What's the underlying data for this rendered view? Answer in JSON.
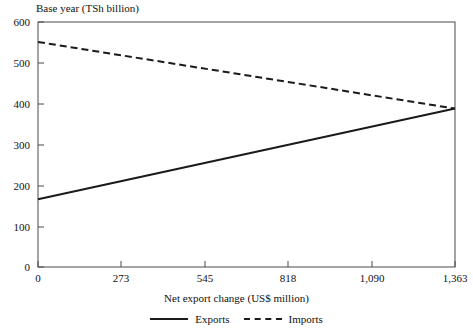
{
  "chart_data": {
    "type": "line",
    "title": "",
    "ylabel": "Base year (TSh billion)",
    "xlabel": "Net export change (US$ million)",
    "grid": false,
    "legend_position": "bottom-center",
    "xlim": [
      0,
      1363
    ],
    "ylim": [
      0,
      600
    ],
    "x_ticks": [
      0,
      273,
      545,
      818,
      1090,
      1363
    ],
    "x_tick_labels": [
      "0",
      "273",
      "545",
      "818",
      "1,090",
      "1,363"
    ],
    "y_ticks": [
      0,
      100,
      200,
      300,
      400,
      500,
      600
    ],
    "y_tick_labels": [
      "0",
      "100",
      "200",
      "300",
      "400",
      "500",
      "600"
    ],
    "x": [
      0,
      1363
    ],
    "series": [
      {
        "name": "Exports",
        "style": "solid",
        "color": "#1a1a1a",
        "values": [
          166,
          388
        ]
      },
      {
        "name": "Imports",
        "style": "dashed",
        "color": "#1a1a1a",
        "values": [
          551,
          388
        ]
      }
    ]
  },
  "axes": {
    "y_title": "Base year (TSh billion)",
    "x_title": "Net export change (US$ million)",
    "y_tick_labels": [
      "600",
      "500",
      "400",
      "300",
      "200",
      "100",
      "0"
    ],
    "x_tick_labels": [
      "0",
      "273",
      "545",
      "818",
      "1,090",
      "1,363"
    ]
  },
  "legend": {
    "items": [
      {
        "label": "Exports",
        "style": "solid"
      },
      {
        "label": "Imports",
        "style": "dashed"
      }
    ]
  },
  "colors": {
    "line": "#1a1a1a",
    "frame": "#4a4a4a",
    "text": "#111111",
    "background": "#ffffff"
  }
}
